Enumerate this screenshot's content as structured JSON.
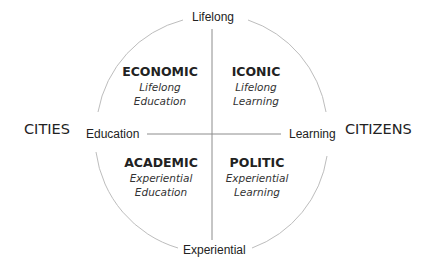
{
  "axes": {
    "top": "Lifelong",
    "bottom": "Experiential",
    "left": "Education",
    "right": "Learning"
  },
  "sides": {
    "left": "CITIES",
    "right": "CITIZENS"
  },
  "quadrants": [
    {
      "position": "top-left",
      "title": "ECONOMIC",
      "line1": "Lifelong",
      "line2": "Education"
    },
    {
      "position": "top-right",
      "title": "ICONIC",
      "line1": "Lifelong",
      "line2": "Learning"
    },
    {
      "position": "bottom-left",
      "title": "ACADEMIC",
      "line1": "Experiential",
      "line2": "Education"
    },
    {
      "position": "bottom-right",
      "title": "POLITIC",
      "line1": "Experiential",
      "line2": "Learning"
    }
  ],
  "colors": {
    "circle": "#b8b8b8",
    "axis_lines": "#8c8c8c",
    "text": "#222222"
  }
}
